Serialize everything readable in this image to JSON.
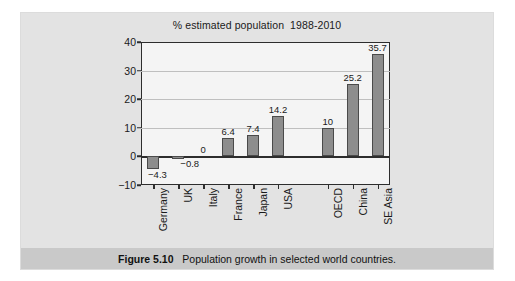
{
  "figure": {
    "caption_label": "Figure 5.10",
    "caption_text": "Population growth in selected world countries.",
    "caption_gap": "   "
  },
  "colors": {
    "panel_background": "#e3e3e3",
    "plot_background": "#f4f4f4",
    "bar_fill": "#8d8d8d",
    "bar_border": "#4a4a4a",
    "axis": "#2d2d2d",
    "gridline": "#bfbfbf",
    "caption_band": "#c9c9c9"
  },
  "chart_data": {
    "type": "bar",
    "title": "% estimated population  1988-2010",
    "xlabel": "",
    "ylabel": "",
    "ylim": [
      -10,
      40
    ],
    "yticks": [
      40,
      30,
      20,
      10,
      0,
      -10
    ],
    "ytick_labels": [
      "40",
      "30",
      "20",
      "10",
      "0",
      "−10"
    ],
    "grid": true,
    "legend": "none",
    "categories": [
      "Germany",
      "UK",
      "Italy",
      "France",
      "Japan",
      "USA",
      "OECD",
      "China",
      "SE Asia"
    ],
    "values": [
      -4.3,
      -0.8,
      0,
      6.4,
      7.4,
      14.2,
      10,
      25.2,
      35.7
    ],
    "value_labels": [
      "−4.3",
      "−0.8",
      "0",
      "6.4",
      "7.4",
      "14.2",
      "10",
      "25.2",
      "35.7"
    ],
    "group_gap_after_index": 5
  }
}
